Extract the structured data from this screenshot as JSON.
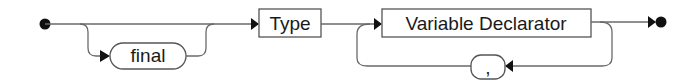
{
  "diagram": {
    "type": "syntax-railroad",
    "nodes": {
      "final": {
        "label": "final",
        "kind": "terminal",
        "optional": true
      },
      "type": {
        "label": "Type",
        "kind": "nonterminal"
      },
      "variable_declarator": {
        "label": "Variable Declarator",
        "kind": "nonterminal",
        "repeatable": true
      },
      "comma": {
        "label": ",",
        "kind": "terminal",
        "role": "separator"
      }
    },
    "sequence": [
      "start",
      "final (optional)",
      "Type",
      "Variable Declarator",
      "(, Variable Declarator)*",
      "end"
    ],
    "colors": {
      "line": "#6a6a6a",
      "box_stroke": "#555555",
      "arrow": "#111111",
      "text": "#1a1a1a",
      "background": "#ffffff"
    }
  }
}
